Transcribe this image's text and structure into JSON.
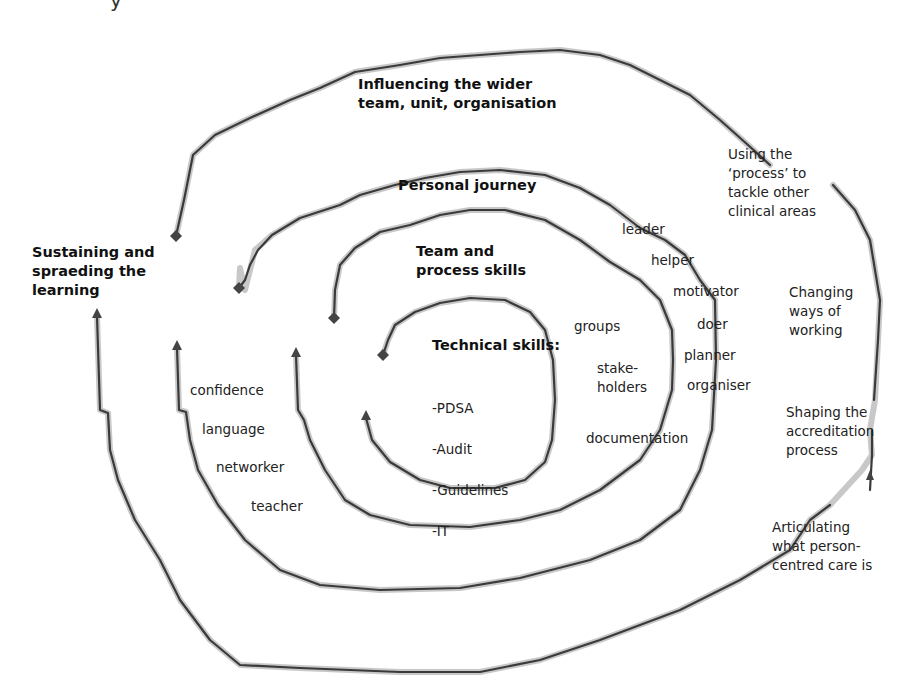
{
  "diagram": {
    "type": "spiral",
    "rings": [
      {
        "id": "technical",
        "title": "Technical skills:",
        "items": [
          "-PDSA",
          "-Audit",
          "-Guidelines",
          "-IT"
        ],
        "side_labels": [
          "groups",
          "stake-\nholders",
          "documentation"
        ]
      },
      {
        "id": "team",
        "title": "Team and\nprocess skills",
        "side_labels": [
          "leader",
          "helper",
          "motivator",
          "doer",
          "planner",
          "organiser"
        ]
      },
      {
        "id": "personal",
        "title": "Personal journey",
        "side_labels": [
          "confidence",
          "language",
          "networker",
          "teacher"
        ]
      },
      {
        "id": "influencing",
        "title": "Influencing the wider\nteam, unit, organisation",
        "side_labels": [
          "Using the\n‘process’ to\ntackle other\nclinical areas",
          "Changing\nways of\nworking",
          "Shaping the\naccreditation\nprocess",
          "Articulating\nwhat person-\ncentred care is"
        ]
      }
    ],
    "outer_label": "Sustaining and\nspraeding the\nlearning",
    "top_cut_text": "y"
  },
  "colors": {
    "line": "#3a3a3a",
    "shadow": "#9a9a9a",
    "text": "#1a1a1a",
    "background": "#ffffff"
  }
}
